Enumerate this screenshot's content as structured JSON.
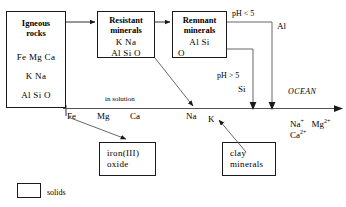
{
  "diagram": {
    "boxes": [
      {
        "id": "igneous-rocks",
        "name": "igneous-rocks-box",
        "title_lines": [
          "Igneous",
          "rocks"
        ],
        "content_lines": [
          "Fe  Mg  Ca",
          "K   Na",
          "Al  Si  O"
        ]
      },
      {
        "id": "resistant-minerals",
        "name": "resistant-minerals-box",
        "title_lines": [
          "Resistant",
          "minerals"
        ],
        "content_lines": [
          "K     Na",
          "Al  Si  O"
        ]
      },
      {
        "id": "remnant-minerals",
        "name": "remnant-minerals-box",
        "title_lines": [
          "Remnant",
          "minerals"
        ],
        "content_lines": [
          "Al    Si",
          "O"
        ]
      },
      {
        "id": "iron-oxide",
        "name": "iron-oxide-box",
        "title_lines": [],
        "content_lines": [
          "iron(III)",
          "oxide"
        ]
      },
      {
        "id": "clay-minerals",
        "name": "clay-minerals-box",
        "title_lines": [],
        "content_lines": [
          "clay",
          "minerals"
        ]
      }
    ],
    "labels": {
      "ph_low": "pH < 5",
      "ph_high": "pH > 5",
      "al": "Al",
      "si": "Si",
      "in_solution": "in solution",
      "ocean": "OCEAN"
    },
    "solution_elements": [
      "Fe",
      "Mg",
      "Ca",
      "Na",
      "K"
    ],
    "ocean_ions_line1": "Na+ Mg2+",
    "ocean_ions_line2": "Ca2+",
    "ocean_ions_line1_parts": [
      {
        "base": "Na",
        "sup": "+"
      },
      {
        "base": "Mg",
        "sup": "2+"
      }
    ],
    "ocean_ions_line2_parts": [
      {
        "base": "Ca",
        "sup": "2+"
      }
    ],
    "legend": {
      "swatch_name": "solids-swatch",
      "label": "solids"
    },
    "colors": {
      "stroke": "#1a1a1a",
      "line": "#555555",
      "background": "#ffffff",
      "text": "#000000"
    }
  }
}
